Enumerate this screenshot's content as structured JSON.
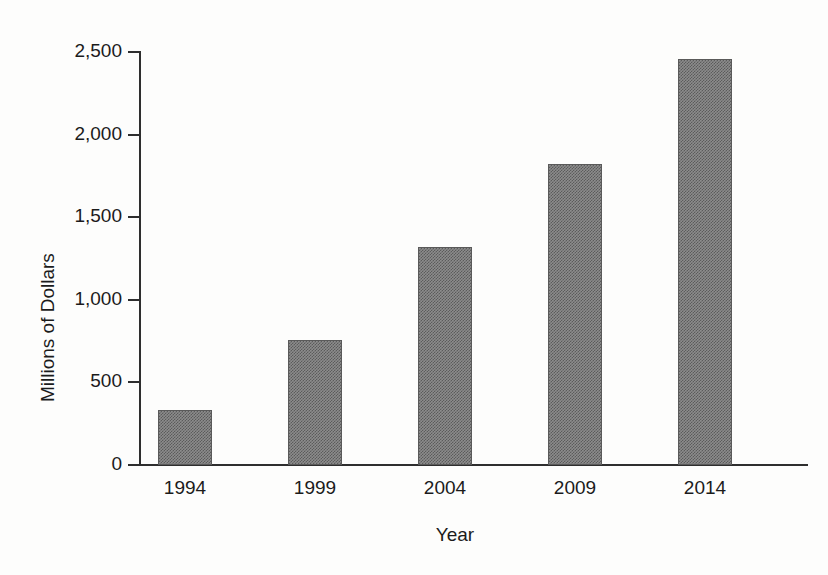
{
  "chart_data": {
    "type": "bar",
    "title": "",
    "xlabel": "Year",
    "ylabel": "Millions of Dollars",
    "categories": [
      "1994",
      "1999",
      "2004",
      "2009",
      "2014"
    ],
    "values": [
      335,
      755,
      1320,
      1820,
      2460
    ],
    "ylim": [
      0,
      2500
    ],
    "yticks": [
      0,
      500,
      1000,
      1500,
      2000,
      2500
    ],
    "ytick_labels": [
      "0",
      "500",
      "1,000",
      "1,500",
      "2,000",
      "2,500"
    ],
    "grid": false,
    "legend": "none",
    "bar_fill_color": "#8c8c8c",
    "bar_edge_color": "#5a5a5a",
    "axis_color": "#2e2e2e",
    "background_color": "#fdfdfc"
  }
}
